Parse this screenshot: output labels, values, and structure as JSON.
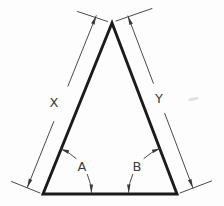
{
  "figure": {
    "type": "technical-drawing",
    "labels": {
      "left_side_dimension": "X",
      "right_side_dimension": "Y",
      "left_base_angle": "A",
      "right_base_angle": "B"
    }
  },
  "colors": {
    "background": "#fdfdfd",
    "object_line": "#1b1b1b",
    "dimension_line": "#4a4a4a",
    "arrowhead": "#3a3a3a",
    "label_text": "#3d3d3d"
  }
}
